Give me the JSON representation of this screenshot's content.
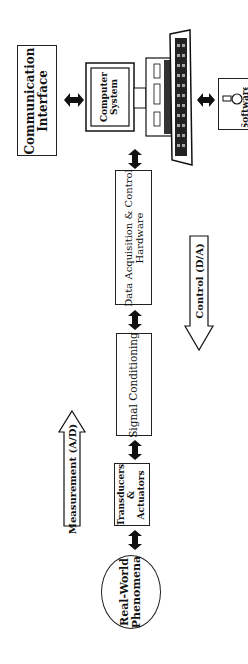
{
  "diagram": {
    "orientation": "rotated 90 degrees counter-clockwise",
    "nodes": {
      "communication_interface": {
        "line1": "Communication",
        "line2": "Interface"
      },
      "computer_system": {
        "line1": "Computer",
        "line2": "System"
      },
      "software": {
        "label": "Software"
      },
      "daq_hardware": {
        "line1": "Data Acquisition & Control",
        "line2": "Hardware"
      },
      "signal_conditioning": {
        "label": "Signal Conditioning"
      },
      "transducers": {
        "line1": "Transducers",
        "line2": "&",
        "line3": "Actuators"
      },
      "real_world": {
        "line1": "Real-World",
        "line2": "Phenomena"
      }
    },
    "flow_arrows": {
      "measurement": {
        "label": "Measurement (A/D)",
        "direction": "toward computer"
      },
      "control": {
        "label": "Control (D/A)",
        "direction": "toward real world"
      }
    },
    "connections": [
      {
        "from": "communication_interface",
        "to": "computer_system",
        "type": "bidirectional"
      },
      {
        "from": "computer_system",
        "to": "software",
        "type": "bidirectional"
      },
      {
        "from": "computer_system",
        "to": "daq_hardware",
        "type": "bidirectional"
      },
      {
        "from": "daq_hardware",
        "to": "signal_conditioning",
        "type": "bidirectional"
      },
      {
        "from": "signal_conditioning",
        "to": "transducers",
        "type": "bidirectional"
      },
      {
        "from": "transducers",
        "to": "real_world",
        "type": "bidirectional"
      }
    ]
  }
}
